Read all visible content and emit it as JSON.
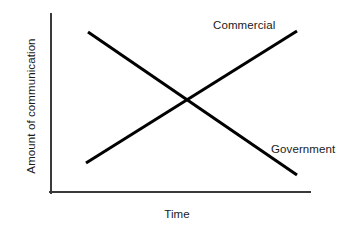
{
  "chart_data": {
    "type": "line",
    "title": "",
    "subtitle": "",
    "xlabel": "Time",
    "ylabel": "Amount of communication",
    "xlim": [
      0,
      100
    ],
    "ylim": [
      0,
      100
    ],
    "grid": false,
    "axis_ticks": false,
    "legend": "inline-end-labels",
    "line_color": "#000000",
    "axis_color": "#3a3a3a",
    "background_color": "#ffffff",
    "series": [
      {
        "name": "Commercial",
        "label_position": "top-right",
        "trend": "increasing",
        "x": [
          17,
          95
        ],
        "values": [
          17,
          90
        ],
        "points": [
          {
            "x": 17,
            "y": 17
          },
          {
            "x": 95,
            "y": 90
          }
        ]
      },
      {
        "name": "Government",
        "label_position": "bottom-right",
        "trend": "decreasing",
        "x": [
          18,
          95
        ],
        "values": [
          90,
          10
        ],
        "points": [
          {
            "x": 18,
            "y": 90
          },
          {
            "x": 95,
            "y": 10
          }
        ]
      }
    ],
    "annotations": [
      {
        "text": "Commercial",
        "type": "series-label",
        "series": "Commercial"
      },
      {
        "text": "Government",
        "type": "series-label",
        "series": "Government"
      }
    ],
    "intersection": {
      "x": 50,
      "y": 52
    },
    "geometry": {
      "axis_origin": [
        50,
        193
      ],
      "y_axis_top": [
        50,
        14
      ],
      "x_axis_right": [
        310,
        193
      ],
      "commercial_pixels": [
        [
          86,
          163
        ],
        [
          297,
          31
        ]
      ],
      "government_pixels": [
        [
          88,
          32
        ],
        [
          297,
          175
        ]
      ]
    }
  },
  "labels": {
    "commercial": "Commercial",
    "government": "Government",
    "x_axis": "Time",
    "y_axis": "Amount of communication"
  }
}
